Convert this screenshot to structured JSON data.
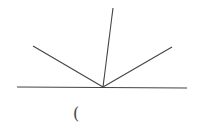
{
  "diagram": {
    "stroke_color": "#444444",
    "vertex": {
      "x": 103,
      "y": 87
    },
    "baseline": {
      "x1": 17,
      "y1": 87,
      "x2": 187,
      "y2": 88
    },
    "rays": [
      {
        "name": "left-ray",
        "x": 33,
        "y": 46
      },
      {
        "name": "upper-ray",
        "x": 113,
        "y": 8
      },
      {
        "name": "right-ray",
        "x": 172,
        "y": 47
      }
    ],
    "caption": "("
  }
}
